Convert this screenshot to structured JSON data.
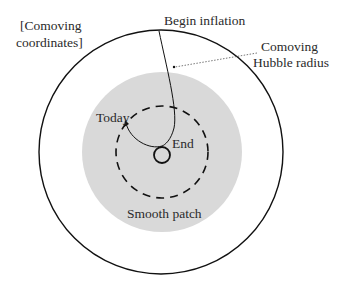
{
  "diagram": {
    "labels": {
      "coordinates_line1": "[Comoving",
      "coordinates_line2": "coordinates]",
      "begin_inflation": "Begin inflation",
      "hubble_line1": "Comoving",
      "hubble_line2": "Hubble radius",
      "today": "Today",
      "end": "End",
      "smooth_patch": "Smooth patch"
    },
    "colors": {
      "line": "#111111",
      "patch_fill": "#d9d9d9",
      "text": "#2a2a2a"
    },
    "shapes": {
      "outer_circle": {
        "cx": 161,
        "cy": 152,
        "r": 122
      },
      "smooth_patch": {
        "cx": 162,
        "cy": 152,
        "r": 80
      },
      "dashed_circle": {
        "cx": 162,
        "cy": 152,
        "r": 47
      },
      "inner_circle": {
        "cx": 162,
        "cy": 154,
        "r": 8
      }
    }
  }
}
